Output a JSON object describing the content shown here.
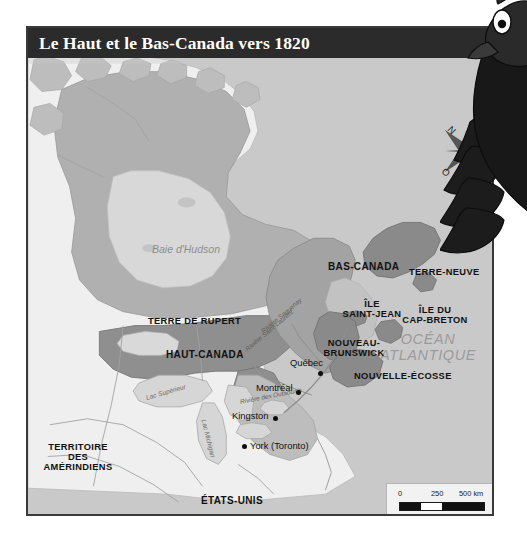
{
  "title": "Le Haut et le Bas-Canada vers 1820",
  "colors": {
    "title_bar": "#2b2b2b",
    "title_text": "#ffffff",
    "ocean": "#c9c9c9",
    "land_light": "#efefef",
    "land_mid": "#bdbdbd",
    "rupert": "#b0b0b0",
    "haut_canada": "#8f8f8f",
    "bas_canada": "#a3a3a3",
    "maritimes": "#8a8a8a",
    "frame": "#3a3a3a",
    "label_dark": "#111111",
    "label_water": "#8d8d8d"
  },
  "regions": [
    {
      "name": "terre-de-rupert",
      "label": "TERRE DE RUPERT",
      "x": 120,
      "y": 290
    },
    {
      "name": "haut-canada",
      "label": "HAUT-CANADA",
      "x": 140,
      "y": 324
    },
    {
      "name": "bas-canada",
      "label": "BAS-CANADA",
      "x": 302,
      "y": 236
    },
    {
      "name": "terre-neuve",
      "label": "TERRE-NEUVE",
      "x": 382,
      "y": 240
    },
    {
      "name": "ile-saint-jean",
      "label": "ÎLE\nSAINT-JEAN",
      "line1": "ÎLE",
      "line2": "SAINT-JEAN",
      "x": 339,
      "y": 272
    },
    {
      "name": "ile-du-cap-breton",
      "label": "ÎLE DU\nCAP-BRETON",
      "line1": "ÎLE DU",
      "line2": "CAP-BRETON",
      "x": 399,
      "y": 278
    },
    {
      "name": "nouveau-brunswick",
      "label": "NOUVEAU-\nBRUNSWICK",
      "line1": "NOUVEAU-",
      "line2": "BRUNSWICK",
      "x": 322,
      "y": 311
    },
    {
      "name": "nouvelle-ecosse",
      "label": "NOUVELLE-ÉCOSSE",
      "x": 355,
      "y": 344
    },
    {
      "name": "territoire-des-amerindiens",
      "label": "TERRITOIRE\nDES\nAMÉRINDIENS",
      "line1": "TERRITOIRE",
      "line2": "DES",
      "line3": "AMÉRINDIENS",
      "x": 35,
      "y": 418
    },
    {
      "name": "etats-unis",
      "label": "ÉTATS-UNIS",
      "x": 200,
      "y": 471
    }
  ],
  "cities": [
    {
      "name": "quebec",
      "label": "Québec",
      "x": 291,
      "y": 336,
      "dot_x": 316,
      "dot_y": 345
    },
    {
      "name": "montreal",
      "label": "Montréal",
      "x": 258,
      "y": 361,
      "dot_x": 290,
      "dot_y": 371
    },
    {
      "name": "kingston",
      "label": "Kingston",
      "x": 236,
      "y": 387,
      "dot_x": 273,
      "dot_y": 393
    },
    {
      "name": "york-toronto",
      "label": "York (Toronto)",
      "x": 248,
      "y": 417,
      "dot_x": 240,
      "dot_y": 421
    }
  ],
  "water_labels": [
    {
      "name": "baie-d-hudson",
      "label": "Baie d'Hudson",
      "x": 124,
      "y": 216
    },
    {
      "name": "ocean-atlantique",
      "line1": "OCÉAN",
      "line2": "ATLANTIQUE",
      "label": "OCÉAN ATLANTIQUE",
      "x": 400,
      "y": 312
    }
  ],
  "rivers": [
    {
      "name": "riviere-saint-laurent",
      "label": "Rivière Saint-Laurent",
      "x": 245,
      "y": 322,
      "rotate": -38
    },
    {
      "name": "riviere-saguenay",
      "label": "Rivière Saguenay",
      "x": 247,
      "y": 315,
      "rotate": -32
    },
    {
      "name": "riviere-des-outaouais",
      "label": "Rivière des Outaouais",
      "x": 238,
      "y": 374,
      "rotate": -12
    }
  ],
  "lakes": [
    {
      "name": "lac-superieur",
      "label": "Lac Supérieur",
      "x": 159,
      "y": 367,
      "rotate": -18
    },
    {
      "name": "lac-michigan",
      "label": "Lac Michigan",
      "x": 190,
      "y": 395,
      "rotate": 74
    }
  ],
  "compass": {
    "north": "N",
    "east": "E",
    "south": "S",
    "west": "O"
  },
  "scale": {
    "zero": "0",
    "mid": "250",
    "max": "500 km"
  },
  "mascot": {
    "name": "cartoon-crow-mascot"
  }
}
